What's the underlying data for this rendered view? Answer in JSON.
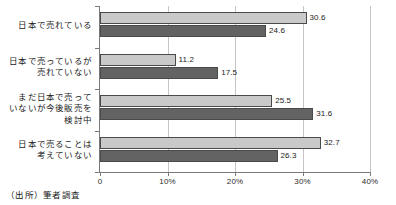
{
  "chart_data": {
    "type": "bar",
    "orientation": "horizontal",
    "title": "",
    "xlabel": "",
    "ylabel": "",
    "xlim": [
      0,
      40
    ],
    "xticks": [
      0,
      10,
      20,
      30,
      40
    ],
    "xticklabels": [
      "0",
      "10%",
      "20%",
      "30%",
      "40%"
    ],
    "grid": true,
    "legend": "none",
    "categories": [
      "日本で売れている",
      "日本で売っているが売れていない",
      "まだ日本で売っていないが今後販売を検討中",
      "日本で売ることは考えていない"
    ],
    "category_lines": [
      [
        "日本で売れている"
      ],
      [
        "日本で売っているが",
        "売れていない"
      ],
      [
        "まだ日本で売って",
        "いないが今後販売を",
        "検討中"
      ],
      [
        "日本で売ることは",
        "考えていない"
      ]
    ],
    "series": [
      {
        "name": "series-1",
        "color": "#c9c9c9",
        "values": [
          30.6,
          11.2,
          25.5,
          32.7
        ],
        "labels": [
          "30.6",
          "11.2",
          "25.5",
          "32.7"
        ]
      },
      {
        "name": "series-2",
        "color": "#636363",
        "values": [
          24.6,
          17.5,
          31.6,
          26.3
        ],
        "labels": [
          "24.6",
          "17.5",
          "31.6",
          "26.3"
        ]
      }
    ]
  },
  "source_note": "（出所）筆者調査"
}
